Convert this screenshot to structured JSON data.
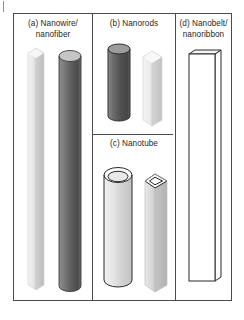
{
  "figure": {
    "kind": "schematic-diagram",
    "panel_count": 4,
    "background_color": "#ffffff",
    "frame_color": "#4a4a4a"
  },
  "panels": [
    {
      "key": "a",
      "caption_line1": "(a) Nanowire/",
      "caption_line2": "nanofiber",
      "objects": [
        {
          "name": "light-hexagonal-prism",
          "shape": "hexagonal-prism",
          "fill": "#e3e3e3",
          "aspect": "very-long",
          "shading": "gradient-light"
        },
        {
          "name": "dark-cylinder",
          "shape": "cylinder",
          "fill": "#6d6d6d",
          "aspect": "very-long",
          "shading": "gradient-dark"
        }
      ]
    },
    {
      "key": "b",
      "caption_line1": "(b) Nanorods",
      "caption_line2": "",
      "objects": [
        {
          "name": "dark-cylinder",
          "shape": "cylinder",
          "fill": "#5f5f5f",
          "aspect": "short",
          "shading": "gradient-dark"
        },
        {
          "name": "light-hexagonal-prism",
          "shape": "hexagonal-prism",
          "fill": "#e6e6e6",
          "aspect": "short",
          "shading": "gradient-light"
        }
      ]
    },
    {
      "key": "c",
      "caption_line1": "(c) Nanotube",
      "caption_line2": "",
      "objects": [
        {
          "name": "hollow-cylindrical-tube",
          "shape": "open-cylinder",
          "fill": "#e0e0e0",
          "aspect": "long",
          "shading": "gradient-light",
          "hollow": true
        },
        {
          "name": "hollow-hexagonal-tube",
          "shape": "open-hexagonal-prism",
          "fill": "#d2d2d2",
          "aspect": "long",
          "shading": "gradient-mid",
          "hollow": true
        }
      ]
    },
    {
      "key": "d",
      "caption_line1": "(d) Nanobelt/",
      "caption_line2": "nanoribbon",
      "objects": [
        {
          "name": "flat-rectangular-belt",
          "shape": "rectangular-slab",
          "fill": "#ffffff",
          "aspect": "very-long-flat",
          "shading": "outline"
        }
      ]
    }
  ],
  "marks": {
    "edge_tick": "|"
  }
}
